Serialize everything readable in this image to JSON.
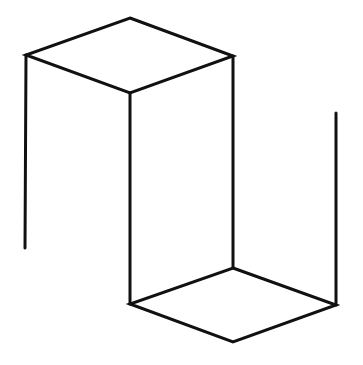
{
  "diagram": {
    "stroke_color": "#111111",
    "stroke_width": 3,
    "background": "#ffffff",
    "top_rhombus": {
      "points": [
        [
          130,
          18
        ],
        [
          233,
          56
        ],
        [
          130,
          93
        ],
        [
          26,
          55
        ]
      ]
    },
    "bottom_rhombus": {
      "points": [
        [
          233,
          268
        ],
        [
          336,
          305
        ],
        [
          233,
          342
        ],
        [
          130,
          304
        ]
      ]
    },
    "verticals": [
      {
        "name": "left-edge",
        "x1": 26,
        "y1": 55,
        "x2": 25,
        "y2": 248
      },
      {
        "name": "front-edge",
        "x1": 130,
        "y1": 93,
        "x2": 130,
        "y2": 304
      },
      {
        "name": "right-upper-edge",
        "x1": 233,
        "y1": 56,
        "x2": 233,
        "y2": 268
      },
      {
        "name": "far-right-edge",
        "x1": 336,
        "y1": 113,
        "x2": 336,
        "y2": 305
      }
    ]
  }
}
